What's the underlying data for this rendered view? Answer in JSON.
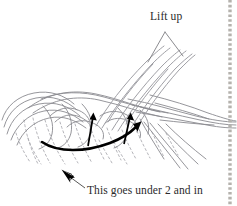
{
  "figure": {
    "kind": "instructional-line-drawing",
    "background_color": "#ffffff",
    "ink_color": "#2b2b2b",
    "strand_color": "#8a8a90",
    "dashed_strand_color": "#a8a8ae",
    "arrow_color": "#000000",
    "binding_edge_color": "#b5b2ad"
  },
  "annotations": {
    "lift_up": {
      "text": "Lift up",
      "leader": "two-line-v-pointer",
      "points_to": "lifted-strands"
    },
    "under_two": {
      "text": "This goes under 2 and in",
      "leader": "single-line-with-arrowhead",
      "points_to": "sweeping-strand"
    }
  },
  "arrows": {
    "left_up_arrow": {
      "name": "lift-arrow-left",
      "direction": "up"
    },
    "right_up_arrow": {
      "name": "lift-arrow-right",
      "direction": "up"
    },
    "curved_sweep_arrow": {
      "name": "sweep-arrow",
      "direction": "left-to-upper-right"
    },
    "label_arrowhead": {
      "name": "callout-arrowhead",
      "direction": "up-left"
    }
  },
  "elements": {
    "braid_band": "horizontal-interwoven-band",
    "lifted_strands": "two-strands-raised-up-right",
    "hidden_strands": "dashed-lines-below-band",
    "trailing_strands": "strands-exiting-right-and-down-right",
    "binding_edge": "dashed-vertical-page-binding-line"
  }
}
